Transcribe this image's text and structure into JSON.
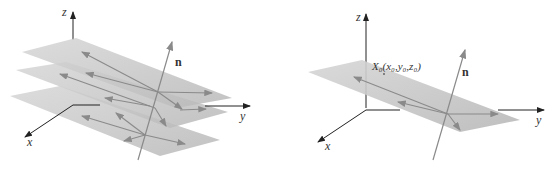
{
  "left_figure": {
    "axis_labels": {
      "x": "x",
      "y": "y",
      "z": "z"
    },
    "normal_label": "n",
    "plane_count": 3
  },
  "right_figure": {
    "axis_labels": {
      "x": "x",
      "y": "y",
      "z": "z"
    },
    "normal_label": "n",
    "point_label": "X₀(x₀,y₀,z₀)",
    "plane_count": 1
  },
  "colors": {
    "plane": "#c4c4c4",
    "arrow": "#8a8a8a",
    "axis": "#222222"
  }
}
